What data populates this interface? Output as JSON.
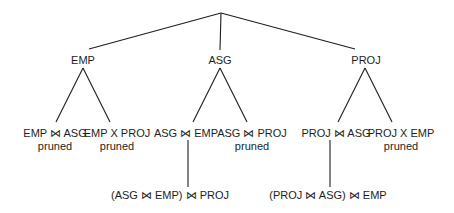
{
  "diagram": {
    "type": "search-tree",
    "root": "",
    "level1": [
      {
        "label": "EMP",
        "x": 83
      },
      {
        "label": "ASG",
        "x": 220
      },
      {
        "label": "PROJ",
        "x": 366
      }
    ],
    "level2": [
      {
        "label": "EMP ⋈ ASG",
        "status": "pruned",
        "x": 55
      },
      {
        "label": "EMP X PROJ",
        "status": "pruned",
        "x": 117
      },
      {
        "label": "ASG ⋈ EMP",
        "status": "",
        "x": 186
      },
      {
        "label": "ASG ⋈ PROJ",
        "status": "pruned",
        "x": 252
      },
      {
        "label": "PROJ ⋈ ASG",
        "status": "",
        "x": 336
      },
      {
        "label": "PROJ X  EMP",
        "status": "pruned",
        "x": 400
      }
    ],
    "level3": [
      {
        "label": "(ASG ⋈ EMP) ⋈ PROJ",
        "x": 188
      },
      {
        "label": "(PROJ ⋈ ASG) ⋈ EMP",
        "x": 332
      }
    ],
    "line_color": "#1e1e1e"
  }
}
